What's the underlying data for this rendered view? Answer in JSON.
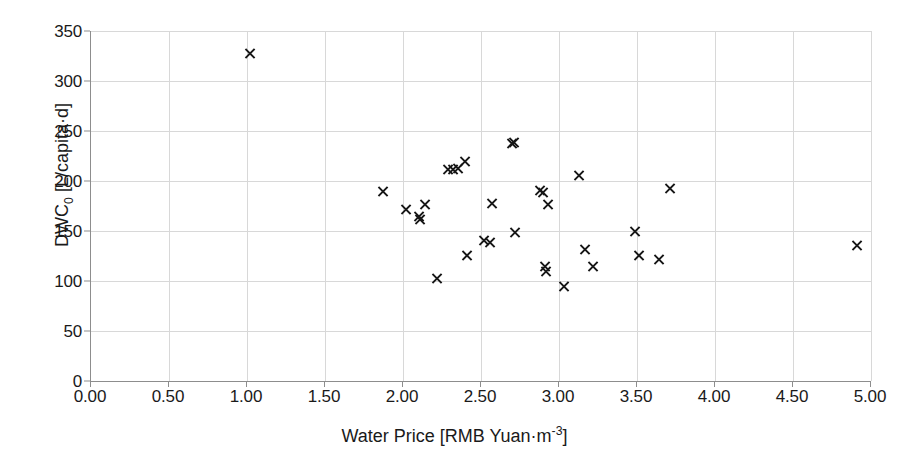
{
  "chart_data": {
    "type": "scatter",
    "title": "",
    "xlabel": "Water Price [RMB Yuan·m⁻³]",
    "ylabel": "DWC₀ [L/capita·d]",
    "xlim": [
      0.0,
      5.0
    ],
    "ylim": [
      0,
      350
    ],
    "xticks": [
      "0.00",
      "0.50",
      "1.00",
      "1.50",
      "2.00",
      "2.50",
      "3.00",
      "3.50",
      "4.00",
      "4.50",
      "5.00"
    ],
    "xtick_values": [
      0.0,
      0.5,
      1.0,
      1.5,
      2.0,
      2.5,
      3.0,
      3.5,
      4.0,
      4.5,
      5.0
    ],
    "yticks": [
      "0",
      "50",
      "100",
      "150",
      "200",
      "250",
      "300",
      "350"
    ],
    "ytick_values": [
      0,
      50,
      100,
      150,
      200,
      250,
      300,
      350
    ],
    "grid": true,
    "legend": "none",
    "marker": "x",
    "marker_color": "#171717",
    "grid_color": "#d8d8d8",
    "axis_color": "#8d8d8d",
    "series": [
      {
        "name": "Cities",
        "points": [
          [
            1.02,
            328
          ],
          [
            1.87,
            190
          ],
          [
            2.02,
            172
          ],
          [
            2.1,
            165
          ],
          [
            2.11,
            162
          ],
          [
            2.14,
            177
          ],
          [
            2.22,
            103
          ],
          [
            2.29,
            212
          ],
          [
            2.32,
            212
          ],
          [
            2.35,
            213
          ],
          [
            2.4,
            220
          ],
          [
            2.41,
            126
          ],
          [
            2.52,
            141
          ],
          [
            2.56,
            139
          ],
          [
            2.57,
            178
          ],
          [
            2.7,
            238
          ],
          [
            2.71,
            239
          ],
          [
            2.72,
            149
          ],
          [
            2.88,
            191
          ],
          [
            2.9,
            189
          ],
          [
            2.91,
            115
          ],
          [
            2.92,
            110
          ],
          [
            2.93,
            177
          ],
          [
            3.03,
            95
          ],
          [
            3.13,
            206
          ],
          [
            3.17,
            132
          ],
          [
            3.22,
            115
          ],
          [
            3.49,
            150
          ],
          [
            3.51,
            126
          ],
          [
            3.64,
            122
          ],
          [
            3.71,
            193
          ],
          [
            4.91,
            136
          ]
        ]
      }
    ]
  }
}
